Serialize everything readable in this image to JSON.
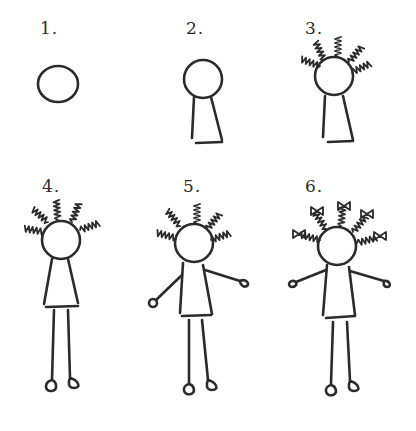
{
  "steps": [
    {
      "label": "1.",
      "description": "head circle"
    },
    {
      "label": "2.",
      "description": "head and dress"
    },
    {
      "label": "3.",
      "description": "add braids"
    },
    {
      "label": "4.",
      "description": "add legs and feet"
    },
    {
      "label": "5.",
      "description": "add arms and hands"
    },
    {
      "label": "6.",
      "description": "add bows to braids"
    }
  ],
  "colors": {
    "ink": "#2b2b2b",
    "paper": "#ffffff"
  }
}
